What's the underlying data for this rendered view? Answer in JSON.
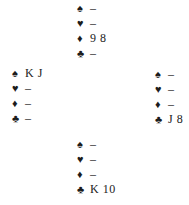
{
  "colors": {
    "background": "#ffffff",
    "text": "#1c1c1c"
  },
  "hands": {
    "north": {
      "suits": [
        {
          "suit": "spades",
          "symbol": "♠",
          "cards": "–"
        },
        {
          "suit": "hearts",
          "symbol": "♥",
          "cards": "–"
        },
        {
          "suit": "diamonds",
          "symbol": "♦",
          "cards": "9 8"
        },
        {
          "suit": "clubs",
          "symbol": "♣",
          "cards": "–"
        }
      ]
    },
    "west": {
      "suits": [
        {
          "suit": "spades",
          "symbol": "♠",
          "cards": "K J"
        },
        {
          "suit": "hearts",
          "symbol": "♥",
          "cards": "–"
        },
        {
          "suit": "diamonds",
          "symbol": "♦",
          "cards": "–"
        },
        {
          "suit": "clubs",
          "symbol": "♣",
          "cards": "–"
        }
      ]
    },
    "east": {
      "suits": [
        {
          "suit": "spades",
          "symbol": "♠",
          "cards": "–"
        },
        {
          "suit": "hearts",
          "symbol": "♥",
          "cards": "–"
        },
        {
          "suit": "diamonds",
          "symbol": "♦",
          "cards": "–"
        },
        {
          "suit": "clubs",
          "symbol": "♣",
          "cards": "J 8"
        }
      ]
    },
    "south": {
      "suits": [
        {
          "suit": "spades",
          "symbol": "♠",
          "cards": "–"
        },
        {
          "suit": "hearts",
          "symbol": "♥",
          "cards": "–"
        },
        {
          "suit": "diamonds",
          "symbol": "♦",
          "cards": "–"
        },
        {
          "suit": "clubs",
          "symbol": "♣",
          "cards": "K 10"
        }
      ]
    }
  }
}
